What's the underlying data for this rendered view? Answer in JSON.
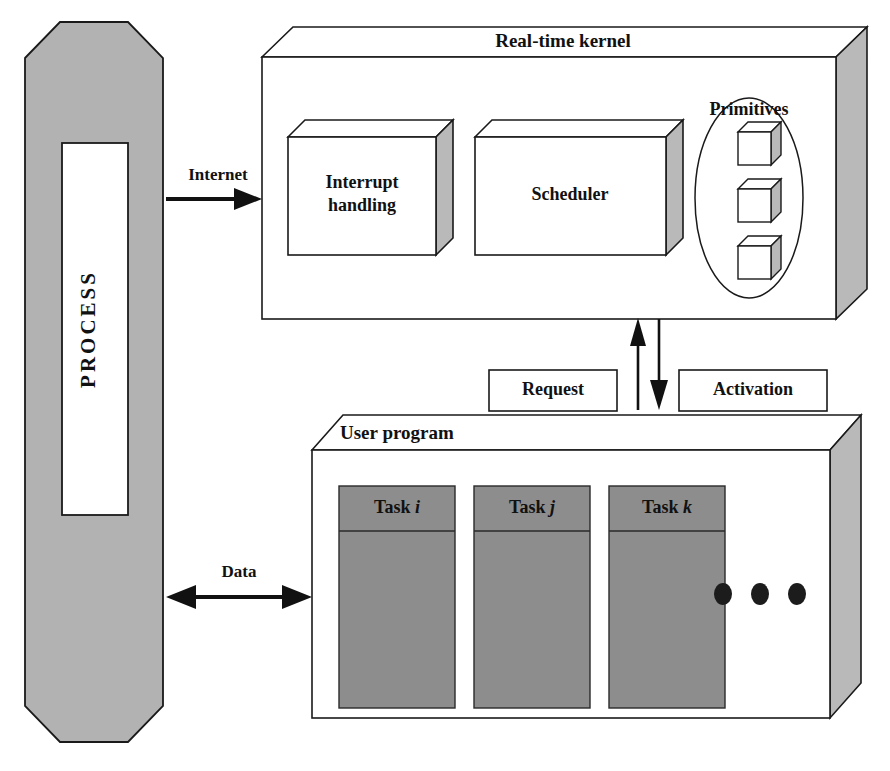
{
  "diagram": {
    "background_color": "#ffffff",
    "line_color": "#1a1a1a"
  },
  "process": {
    "label": "PROCESS",
    "fill_color": "#b2b2b2",
    "window_color": "#ffffff",
    "orientation": "vertical"
  },
  "kernel": {
    "title": "Real-time kernel",
    "side_face_color": "#b9b9b9",
    "front_face_color": "#ffffff",
    "blocks": [
      {
        "label_line1": "Interrupt",
        "label_line2": "handling",
        "name": "interrupt-handling"
      },
      {
        "label_line1": "Scheduler",
        "label_line2": "",
        "name": "scheduler"
      }
    ],
    "primitives": {
      "label": "Primitives",
      "cube_count": 3
    }
  },
  "user_program": {
    "title": "User program",
    "side_face_color": "#b9b9b9",
    "front_face_color": "#ffffff",
    "task_fill_color": "#8d8d8d",
    "tasks": [
      {
        "prefix": "Task",
        "index": "i",
        "name": "task-i"
      },
      {
        "prefix": "Task",
        "index": "j",
        "name": "task-j"
      },
      {
        "prefix": "Task",
        "index": "k",
        "name": "task-k"
      }
    ],
    "ellipsis_dot_count": 3
  },
  "connectors": {
    "internet": {
      "label": "Internet",
      "direction": "right",
      "from": "process",
      "to": "kernel"
    },
    "data": {
      "label": "Data",
      "direction": "bidirectional",
      "from": "process",
      "to": "user_program"
    },
    "request": {
      "label": "Request",
      "direction": "up",
      "from": "user_program",
      "to": "kernel"
    },
    "activation": {
      "label": "Activation",
      "direction": "down",
      "from": "kernel",
      "to": "user_program"
    }
  }
}
